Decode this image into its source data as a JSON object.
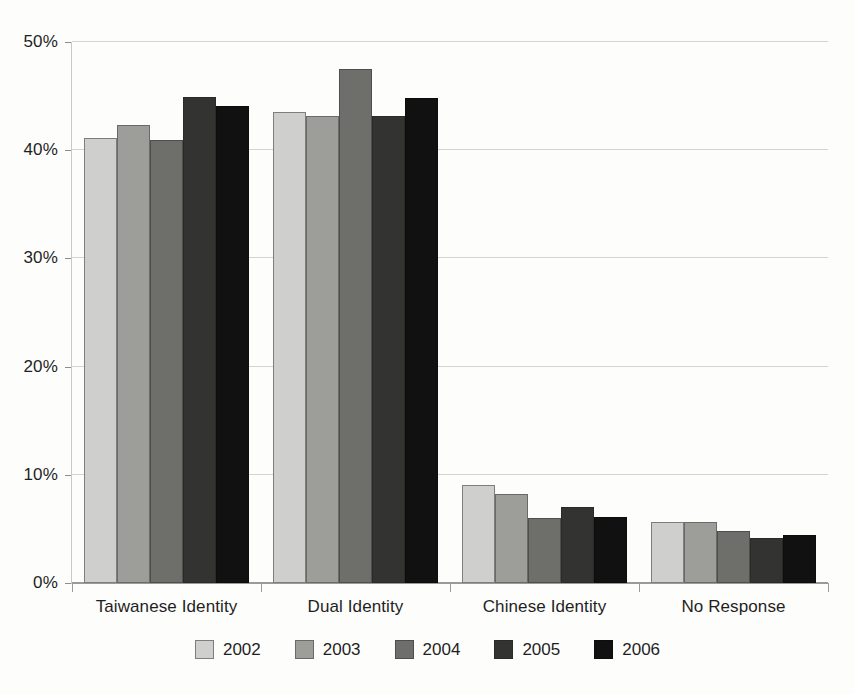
{
  "chart_data": {
    "type": "bar",
    "title": "",
    "subtitle": "",
    "xlabel": "",
    "ylabel": "",
    "ylim": [
      0,
      50
    ],
    "y_ticks": [
      0,
      10,
      20,
      30,
      40,
      50
    ],
    "y_tick_labels": [
      "0%",
      "10%",
      "20%",
      "30%",
      "40%",
      "50%"
    ],
    "grid": true,
    "legend_position": "bottom",
    "value_suffix": "%",
    "categories": [
      "Taiwanese Identity",
      "Dual Identity",
      "Chinese Identity",
      "No Response"
    ],
    "series": [
      {
        "name": "2002",
        "color": "#cfcfcd",
        "values": [
          41.1,
          43.5,
          9.1,
          5.6
        ]
      },
      {
        "name": "2003",
        "color": "#9d9d9a",
        "values": [
          42.3,
          43.2,
          8.2,
          5.6
        ]
      },
      {
        "name": "2004",
        "color": "#6e6e6b",
        "values": [
          40.9,
          47.5,
          6.0,
          4.8
        ]
      },
      {
        "name": "2005",
        "color": "#333332",
        "values": [
          44.9,
          43.2,
          7.0,
          4.2
        ]
      },
      {
        "name": "2006",
        "color": "#111111",
        "values": [
          44.1,
          44.8,
          6.1,
          4.4
        ]
      }
    ]
  }
}
